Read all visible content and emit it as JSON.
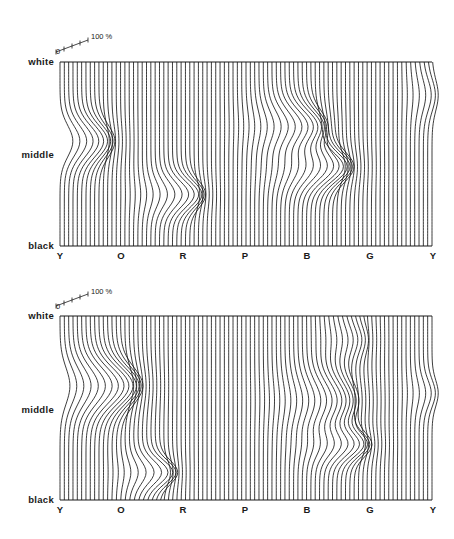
{
  "figure": {
    "x_labels": [
      "Y",
      "O",
      "R",
      "P",
      "B",
      "G",
      "Y"
    ],
    "y_labels": {
      "top": "white",
      "middle": "middle",
      "bottom": "black"
    },
    "scale": {
      "zero": "0",
      "max": "100 %"
    },
    "line_color": "#1a1a1a",
    "line_count": 87
  },
  "panels": [
    {
      "id": "top",
      "box": {
        "left": 60,
        "top": 62,
        "right": 432,
        "bottom": 246
      },
      "bumps": [
        {
          "cx": 82,
          "cy": 0.43,
          "sx": 30,
          "sy": 0.12,
          "amp": 22
        },
        {
          "cx": 175,
          "cy": 0.72,
          "sx": 26,
          "sy": 0.1,
          "amp": 22
        },
        {
          "cx": 292,
          "cy": 0.35,
          "sx": 32,
          "sy": 0.12,
          "amp": 24
        },
        {
          "cx": 315,
          "cy": 0.57,
          "sx": 34,
          "sy": 0.11,
          "amp": 28
        },
        {
          "cx": 425,
          "cy": 0.18,
          "sx": 14,
          "sy": 0.12,
          "amp": 8
        }
      ]
    },
    {
      "id": "bottom",
      "box": {
        "left": 60,
        "top": 316,
        "right": 432,
        "bottom": 500
      },
      "bumps": [
        {
          "cx": 100,
          "cy": 0.38,
          "sx": 38,
          "sy": 0.14,
          "amp": 30
        },
        {
          "cx": 150,
          "cy": 0.85,
          "sx": 22,
          "sy": 0.09,
          "amp": 22
        },
        {
          "cx": 325,
          "cy": 0.46,
          "sx": 38,
          "sy": 0.14,
          "amp": 18
        },
        {
          "cx": 340,
          "cy": 0.7,
          "sx": 30,
          "sy": 0.09,
          "amp": 22
        },
        {
          "cx": 350,
          "cy": 0.13,
          "sx": 22,
          "sy": 0.1,
          "amp": 8
        },
        {
          "cx": 425,
          "cy": 0.42,
          "sx": 14,
          "sy": 0.1,
          "amp": 8
        }
      ]
    }
  ],
  "labels": {
    "panel_top": {
      "white": "white",
      "middle": "middle",
      "black": "black",
      "x": [
        "Y",
        "O",
        "R",
        "P",
        "B",
        "G",
        "Y"
      ],
      "scale_zero": "0",
      "scale_max": "100 %"
    },
    "panel_bottom": {
      "white": "white",
      "middle": "middle",
      "black": "black",
      "x": [
        "Y",
        "O",
        "R",
        "P",
        "B",
        "G",
        "Y"
      ],
      "scale_zero": "0",
      "scale_max": "100 %"
    }
  }
}
